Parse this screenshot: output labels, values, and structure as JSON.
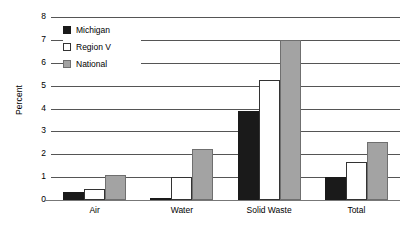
{
  "chart_data": {
    "type": "bar",
    "title": "",
    "xlabel": "",
    "ylabel": "Percent",
    "ylim": [
      0,
      8
    ],
    "yticks": [
      0,
      1,
      2,
      3,
      4,
      5,
      6,
      7,
      8
    ],
    "grid": true,
    "legend_position": "inside-top-left",
    "categories": [
      "Air",
      "Water",
      "Solid Waste",
      "Total"
    ],
    "series": [
      {
        "name": "Michigan",
        "color": "#1a1a1a",
        "values": [
          0.35,
          0.0,
          3.9,
          1.0
        ]
      },
      {
        "name": "Region V",
        "color": "#ffffff",
        "values": [
          0.5,
          1.0,
          5.25,
          1.65
        ]
      },
      {
        "name": "National",
        "color": "#a3a3a3",
        "values": [
          1.1,
          2.25,
          7.0,
          2.55
        ]
      }
    ]
  },
  "axis": {
    "y_title": "Percent"
  },
  "legend": {
    "items": [
      {
        "label": "Michigan"
      },
      {
        "label": "Region V"
      },
      {
        "label": "National"
      }
    ]
  }
}
